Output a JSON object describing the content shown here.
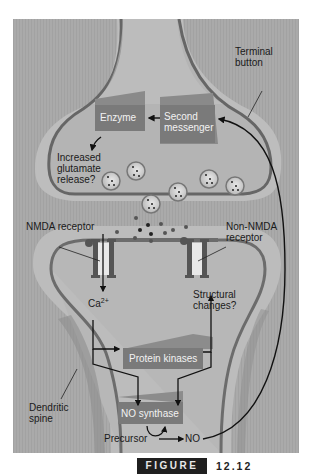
{
  "figure": {
    "badge_label": "FIGURE",
    "number": "12.12"
  },
  "labels": {
    "terminal_button": [
      "Terminal",
      "button"
    ],
    "enzyme": "Enzyme",
    "second_messenger": [
      "Second",
      "messenger"
    ],
    "increased_glutamate": [
      "Increased",
      "glutamate",
      "release?"
    ],
    "nmda_receptor": "NMDA receptor",
    "non_nmda_receptor": [
      "Non-NMDA",
      "receptor"
    ],
    "ca2": "Ca",
    "ca2_sup": "2+",
    "structural_changes": [
      "Structural",
      "changes?"
    ],
    "protein_kinases": "Protein kinases",
    "dendritic_spine": [
      "Dendritic",
      "spine"
    ],
    "no_synthase": "NO synthase",
    "precursor": "Precursor",
    "no": "NO"
  },
  "colors": {
    "background": "#a9a9a9",
    "membrane": "#6f6f6f",
    "cytoplasm": "#b8b8b8",
    "box_fill": "#7a7a7a",
    "arrow": "#111111"
  }
}
